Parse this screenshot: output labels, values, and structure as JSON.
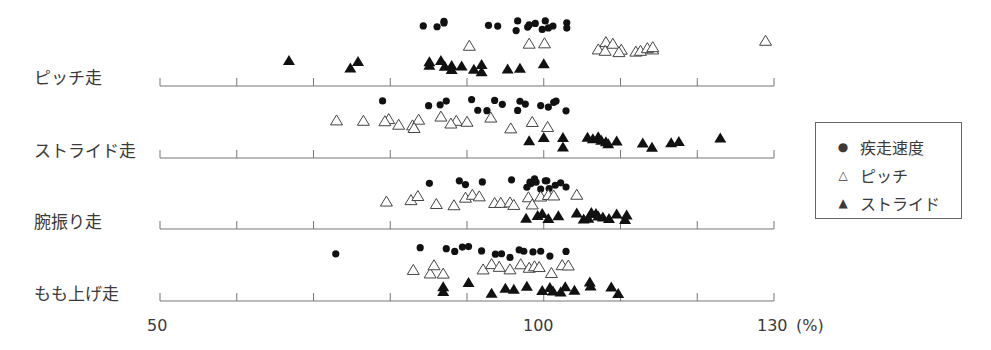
{
  "chart_data": {
    "type": "scatter",
    "title": "",
    "xlabel": "(%)",
    "ylabel": "",
    "xlim": [
      50,
      130
    ],
    "x_ticks": [
      50,
      60,
      70,
      80,
      90,
      100,
      110,
      120,
      130
    ],
    "x_tick_labels": [
      "50",
      "100",
      "130"
    ],
    "x_unit_label": "(%)",
    "grid": false,
    "legend_position": "right",
    "categories": [
      "ピッチ走",
      "ストライド走",
      "腕振り走",
      "もも上げ走"
    ],
    "series": [
      {
        "name": "疾走速度",
        "marker": "filled-circle",
        "values": {
          "ピッチ走": [
            84.3,
            86.1,
            87.0,
            87.0,
            92.8,
            94.0,
            96.6,
            96.4,
            97.9,
            98.1,
            98.9,
            99.8,
            100.6,
            100.2,
            101.2,
            103.0,
            103.0
          ],
          "ストライド走": [
            79.0,
            85.0,
            86.5,
            87.3,
            90.6,
            91.4,
            92.6,
            93.6,
            94.6,
            96.6,
            96.9,
            97.6,
            99.6,
            100.6,
            101.3,
            101.6,
            102.9
          ],
          "腕振り走": [
            85.1,
            89.0,
            89.8,
            92.0,
            95.8,
            97.8,
            98.2,
            99.0,
            98.8,
            99.6,
            100.4,
            100.7,
            98.3,
            100.2,
            101.5,
            102.2,
            102.9
          ],
          "もも上げ走": [
            72.9,
            83.9,
            87.3,
            88.4,
            89.4,
            90.2,
            91.9,
            93.7,
            94.5,
            95.6,
            96.8,
            97.4,
            98.6,
            99.6,
            100.8,
            102.9
          ]
        }
      },
      {
        "name": "ピッチ",
        "marker": "open-triangle",
        "values": {
          "ピッチ走": [
            90.3,
            98.1,
            100.1,
            107.1,
            108.1,
            109.0,
            110.1,
            108.0,
            109.8,
            112.0,
            112.6,
            114.2,
            113.5,
            114.2,
            128.9
          ],
          "ストライド走": [
            73.0,
            76.5,
            79.8,
            79.3,
            81.1,
            82.9,
            83.7,
            83.1,
            86.6,
            88.6,
            87.9,
            90.0,
            93.1,
            95.7,
            98.5,
            100.5
          ],
          "腕振り走": [
            79.5,
            82.7,
            83.6,
            86.0,
            88.3,
            89.8,
            90.7,
            91.6,
            93.6,
            94.4,
            95.6,
            96.1,
            98.0,
            98.5,
            99.6,
            100.6,
            101.3,
            104.3
          ],
          "もも上げ走": [
            83.0,
            85.2,
            86.9,
            85.7,
            92.1,
            93.2,
            94.2,
            95.6,
            97.0,
            98.1,
            98.8,
            99.4,
            101.0,
            102.4,
            103.2
          ]
        }
      },
      {
        "name": "ストライド",
        "marker": "filled-triangle",
        "values": {
          "ピッチ走": [
            66.8,
            74.8,
            75.8,
            85.1,
            85.1,
            87.1,
            88.0,
            86.6,
            88.0,
            89.3,
            90.9,
            91.9,
            91.9,
            95.3,
            96.9,
            100.0
          ],
          "ストライド走": [
            98.1,
            100.0,
            102.5,
            102.5,
            105.7,
            106.4,
            107.5,
            107.1,
            108.4,
            108.1,
            109.5,
            112.9,
            114.1,
            116.6,
            117.6,
            123.0
          ],
          "腕振り走": [
            97.7,
            99.2,
            99.8,
            100.6,
            101.9,
            104.3,
            105.2,
            105.8,
            106.2,
            106.8,
            107.1,
            107.7,
            108.5,
            109.5,
            110.6,
            110.8
          ],
          "もも上げ走": [
            86.9,
            86.9,
            90.2,
            93.2,
            95.0,
            96.1,
            97.8,
            99.8,
            101.2,
            100.8,
            102.8,
            102.2,
            104.0,
            106.0,
            106.1,
            108.8,
            109.7
          ]
        }
      }
    ]
  },
  "row_labels": [
    "ピッチ走",
    "ストライド走",
    "腕振り走",
    "もも上げ走"
  ],
  "axis": {
    "label_50": "50",
    "label_100": "100",
    "label_130": "130",
    "unit": "(%)"
  },
  "legend": {
    "items": [
      {
        "label": "疾走速度",
        "symbol": "●"
      },
      {
        "label": "ピッチ",
        "symbol": "△"
      },
      {
        "label": "ストライド",
        "symbol": "▲"
      }
    ]
  }
}
